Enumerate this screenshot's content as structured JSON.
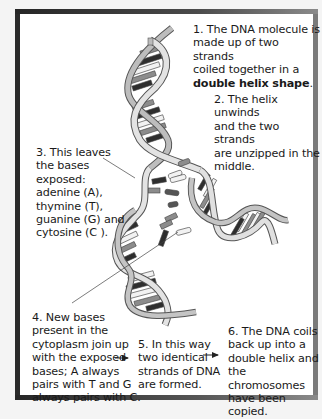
{
  "diagram": {
    "steps": [
      {
        "id": 1,
        "lines": [
          "1. The DNA molecule is",
          "made up of two strands",
          "coiled together in a"
        ],
        "bold_line": "double helix shape",
        "bold_suffix": "."
      },
      {
        "id": 2,
        "lines": [
          "2. The helix unwinds",
          "and the two strands",
          "are unzipped in the",
          "middle."
        ]
      },
      {
        "id": 3,
        "lines": [
          "3. This leaves",
          "the bases",
          "exposed:",
          "adenine (A),",
          "thymine (T),",
          "guanine (G) and",
          "cytosine (C )."
        ]
      },
      {
        "id": 4,
        "lines": [
          "4. New bases",
          "present in the",
          "cytoplasm join up",
          "with the exposed",
          "bases; A always",
          "pairs with T and G",
          "always pairs with C."
        ]
      },
      {
        "id": 5,
        "lines": [
          "5. In this way",
          "two identical",
          "strands of DNA",
          "are formed."
        ]
      },
      {
        "id": 6,
        "lines": [
          "6. The DNA coils",
          "back up into a",
          "double helix and",
          "the chromosomes",
          "have been copied."
        ]
      }
    ],
    "arrows": [
      {
        "from": 4,
        "to": 5,
        "icon": "right-arrow-icon"
      },
      {
        "from": 5,
        "to": 6,
        "icon": "right-arrow-icon"
      }
    ],
    "callouts": [
      {
        "from": 3,
        "target": "exposed-base"
      },
      {
        "from": 4,
        "target": "new-free-base"
      }
    ],
    "colors": {
      "frame": "#2a2a2a",
      "backbone": "#d9d9d9",
      "backbone_outline": "#555555",
      "base_dark": "#2e2e2e",
      "base_mid": "#8c8c8c",
      "base_light": "#f2f2f2"
    }
  }
}
